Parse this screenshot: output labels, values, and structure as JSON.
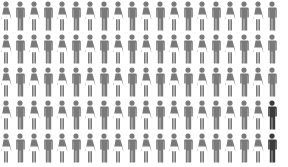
{
  "chart_data": {
    "type": "pictogram",
    "title": "",
    "total": 100,
    "highlighted": 2,
    "percent_highlighted": 2,
    "rows": 5,
    "columns": 20,
    "icon_pattern": [
      "female",
      "male"
    ],
    "highlighted_positions": [
      {
        "row": 4,
        "column": 20
      },
      {
        "row": 5,
        "column": 20
      }
    ],
    "series": [
      {
        "name": "base",
        "count": 98,
        "color": "#7a7a7a"
      },
      {
        "name": "highlighted",
        "count": 2,
        "color": "#3b3b3b"
      }
    ],
    "legend": [],
    "xlabel": "",
    "ylabel": ""
  },
  "colors": {
    "base": "#7a7a7a",
    "highlight": "#3b3b3b",
    "background": "#ffffff"
  }
}
